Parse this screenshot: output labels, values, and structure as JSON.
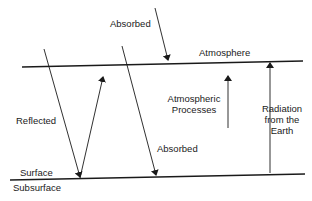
{
  "diagram": {
    "colors": {
      "line": "#1a1a1a",
      "background": "#ffffff"
    },
    "layers": {
      "atmosphere": "Atmosphere",
      "surface": "Surface",
      "subsurface": "Subsurface"
    },
    "labels": {
      "absorbed_top": "Absorbed",
      "reflected": "Reflected",
      "absorbed_surface": "Absorbed",
      "atmospheric_processes_line1": "Atmospheric",
      "atmospheric_processes_line2": "Processes",
      "radiation_line1": "Radiation",
      "radiation_line2": "from the",
      "radiation_line3": "Earth"
    }
  }
}
